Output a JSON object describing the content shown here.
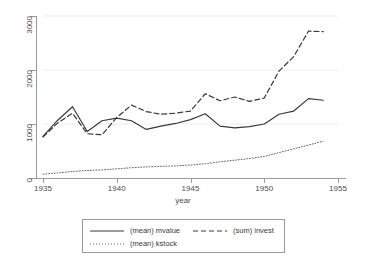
{
  "chart_data": {
    "type": "line",
    "title": "",
    "xlabel": "year",
    "ylabel": "",
    "xlim": [
      1935,
      1955
    ],
    "ylim": [
      0,
      3000
    ],
    "grid": true,
    "grid_axis": "y",
    "legend_position": "bottom",
    "xticks": [
      1935,
      1940,
      1945,
      1950,
      1955
    ],
    "yticks": [
      0,
      1000,
      2000,
      3000
    ],
    "x": [
      1935,
      1936,
      1937,
      1938,
      1939,
      1940,
      1941,
      1942,
      1943,
      1944,
      1945,
      1946,
      1947,
      1948,
      1949,
      1950,
      1951,
      1952,
      1953,
      1954
    ],
    "series": [
      {
        "name": "(mean) mvalue",
        "style": "solid",
        "color": "#3a3a3a",
        "values": [
          770,
          1070,
          1320,
          860,
          1060,
          1110,
          1060,
          900,
          960,
          1010,
          1080,
          1190,
          960,
          930,
          950,
          1000,
          1180,
          1240,
          1470,
          1440
        ]
      },
      {
        "name": "(sum) invest",
        "style": "dashed",
        "color": "#3a3a3a",
        "values": [
          760,
          1020,
          1200,
          820,
          800,
          1120,
          1350,
          1230,
          1180,
          1200,
          1240,
          1560,
          1430,
          1500,
          1420,
          1480,
          1980,
          2250,
          2720,
          2710
        ]
      },
      {
        "name": "(mean) kstock",
        "style": "dotted",
        "color": "#6a6a6a",
        "values": [
          70,
          95,
          120,
          140,
          150,
          170,
          190,
          205,
          215,
          225,
          240,
          265,
          300,
          330,
          360,
          400,
          470,
          540,
          610,
          680
        ]
      }
    ]
  },
  "axis": {
    "x_title": "year",
    "x_tick_labels": [
      "1935",
      "1940",
      "1945",
      "1950",
      "1955"
    ],
    "y_tick_labels": [
      "0",
      "1000",
      "2000",
      "3000"
    ]
  },
  "legend": {
    "entries": [
      {
        "label": "(mean) mvalue",
        "key": "solid-line-key"
      },
      {
        "label": "(sum) invest",
        "key": "dashed-line-key"
      },
      {
        "label": "(mean) kstock",
        "key": "dotted-line-key"
      }
    ]
  },
  "colors": {
    "axis": "#9a9a9a",
    "grid": "#eeeeee",
    "ink": "#3a3a3a",
    "background": "#ffffff"
  }
}
